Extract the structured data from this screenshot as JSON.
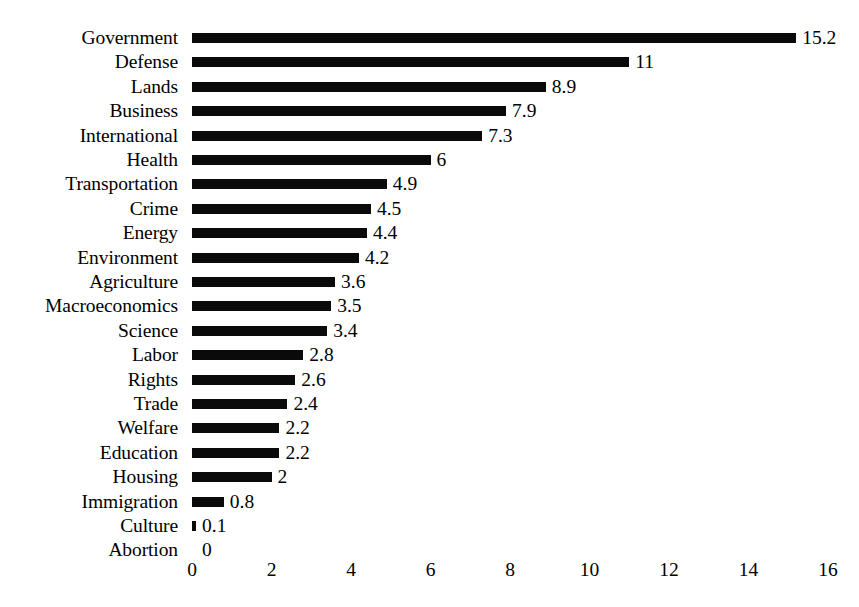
{
  "chart_data": {
    "type": "bar",
    "orientation": "horizontal",
    "title": "",
    "subtitle": "",
    "xlabel": "",
    "ylabel": "",
    "xlim": [
      0,
      16
    ],
    "xticks": [
      "0",
      "2",
      "4",
      "6",
      "8",
      "10",
      "12",
      "14",
      "16"
    ],
    "xtick_values": [
      0,
      2,
      4,
      6,
      8,
      10,
      12,
      14,
      16
    ],
    "grid": false,
    "legend": null,
    "bar_color": "#0a0a0a",
    "background_color": "#ffffff",
    "data_labels_shown": true,
    "categories": [
      "Government",
      "Defense",
      "Lands",
      "Business",
      "International",
      "Health",
      "Transportation",
      "Crime",
      "Energy",
      "Environment",
      "Agriculture",
      "Macroeconomics",
      "Science",
      "Labor",
      "Rights",
      "Trade",
      "Welfare",
      "Education",
      "Housing",
      "Immigration",
      "Culture",
      "Abortion"
    ],
    "values": [
      15.2,
      11,
      8.9,
      7.9,
      7.3,
      6,
      4.9,
      4.5,
      4.4,
      4.2,
      3.6,
      3.5,
      3.4,
      2.8,
      2.6,
      2.4,
      2.2,
      2.2,
      2,
      0.8,
      0.1,
      0
    ],
    "value_labels": [
      "15.2",
      "11",
      "8.9",
      "7.9",
      "7.3",
      "6",
      "4.9",
      "4.5",
      "4.4",
      "4.2",
      "3.6",
      "3.5",
      "3.4",
      "2.8",
      "2.6",
      "2.4",
      "2.2",
      "2.2",
      "2",
      "0.8",
      "0.1",
      "0"
    ]
  }
}
